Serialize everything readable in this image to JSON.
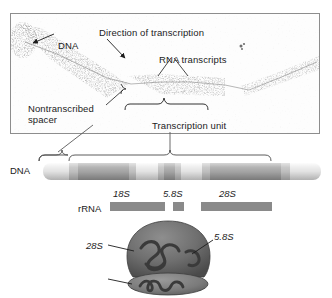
{
  "figure": {
    "micrograph": {
      "labels": {
        "dna": "DNA",
        "direction_of_transcription": "Direction of transcription",
        "rna_transcripts": "RNA transcripts",
        "nontranscribed_spacer": "Nontranscribed spacer",
        "transcription_unit": "Transcription unit"
      }
    },
    "schematic": {
      "dna_label": "DNA",
      "rrna_label": "rRNA",
      "gene_tags": [
        {
          "name": "18S",
          "text": "18S"
        },
        {
          "name": "5.8S",
          "text": "5.8S"
        },
        {
          "name": "28S",
          "text": "28S"
        }
      ]
    },
    "ribosome": {
      "labels": {
        "large_subunit_28s": "28S",
        "small_rna_58s": "5.8S",
        "small_subunit_18s": "18S"
      }
    },
    "colors": {
      "ink": "#1c1c1c",
      "frame": "#8d8d8d",
      "dna_light": "#e2e2e2",
      "dna_dark": "#a3a3a3",
      "rrna_bar": "#8a8a8a",
      "leader": "#3a3a3a"
    }
  }
}
